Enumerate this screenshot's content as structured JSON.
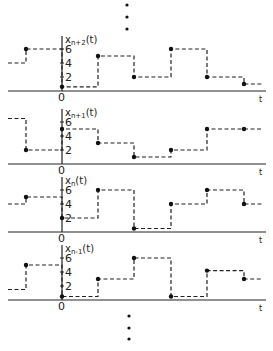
{
  "figure": {
    "ellipsis_top": "⋮",
    "ellipsis_bottom": "⋮",
    "time_axis_label": "t",
    "origin_label": "0",
    "y_ticks": [
      "2",
      "4",
      "6"
    ]
  },
  "chart_data": {
    "type": "step",
    "title": "",
    "xlabel": "t",
    "ylabel": "x(t)",
    "step_period_note": "equal-length intervals; values sampled at each interval start (dots)",
    "yticks": [
      2,
      4,
      6
    ],
    "panels": [
      {
        "name": "x_{n+2}(t)",
        "label_main": "x",
        "label_sub": "n+2",
        "label_tail": "(t)",
        "initial_level": 4,
        "values": [
          6,
          0.6,
          5,
          2,
          6,
          2,
          1
        ]
      },
      {
        "name": "x_{n+1}(t)",
        "label_main": "x",
        "label_sub": "n+1",
        "label_tail": "(t)",
        "initial_level": 6.5,
        "values": [
          2,
          5,
          3,
          1,
          2,
          5,
          5
        ]
      },
      {
        "name": "x_n(t)",
        "label_main": "x",
        "label_sub": "n",
        "label_tail": "(t)",
        "initial_level": 4,
        "values": [
          5,
          2,
          6,
          0.5,
          4,
          6,
          4
        ]
      },
      {
        "name": "x_{n-1}(t)",
        "label_main": "x",
        "label_sub": "n-1",
        "label_tail": "(t)",
        "initial_level": 1.5,
        "values": [
          5,
          0.5,
          3,
          6,
          0.5,
          4.2,
          3
        ]
      }
    ]
  }
}
